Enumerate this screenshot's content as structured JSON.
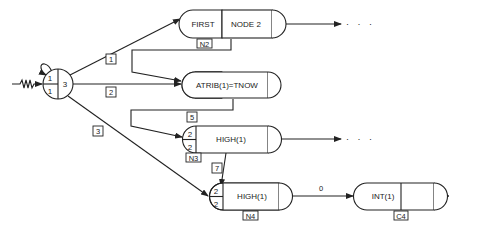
{
  "diagram": {
    "type": "SLAM network",
    "create_node": {
      "top": "1",
      "bottom": "1",
      "right": "3"
    },
    "activities": [
      {
        "id": "1",
        "label": "1"
      },
      {
        "id": "2",
        "label": "2"
      },
      {
        "id": "3",
        "label": "3"
      },
      {
        "id": "5",
        "label": "5"
      },
      {
        "id": "7",
        "label": "7"
      },
      {
        "id": "0",
        "label": "0"
      }
    ],
    "nodes": {
      "first_node": {
        "left": "FIRST",
        "right": "NODE 2",
        "tag": "N2"
      },
      "assign_node": {
        "text": "ATRIB(1)=TNOW"
      },
      "queue_n3": {
        "top": "2",
        "bottom": "2",
        "text": "HIGH(1)",
        "tag": "N3"
      },
      "queue_n4": {
        "top": "2",
        "bottom": "2",
        "text": "HIGH(1)",
        "tag": "N4"
      },
      "collect_c4": {
        "text": "INT(1)",
        "tag": "C4"
      }
    },
    "continuation": "· · ·"
  }
}
